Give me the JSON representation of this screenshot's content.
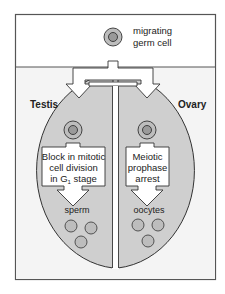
{
  "diagram": {
    "top": {
      "cell_label_line1": "migrating",
      "cell_label_line2": "germ cell"
    },
    "testis": {
      "title": "Testis",
      "box_line1": "Block in mitotic",
      "box_line2": "cell division",
      "box_line3_prefix": "in G",
      "box_line3_sub": "1",
      "box_line3_suffix": " stage",
      "product": "sperm"
    },
    "ovary": {
      "title": "Ovary",
      "box_line1": "Meiotic",
      "box_line2": "prophase",
      "box_line3": "arrest",
      "product": "oocytes"
    },
    "colors": {
      "frame": "#555555",
      "background_lower": "#f4f4f4",
      "gonad_fill": "#cfcfcf",
      "cell_outer": "#bdbdbd",
      "cell_inner": "#9a9a9a",
      "arrow_fill": "#ffffff",
      "stroke": "#333333"
    }
  }
}
